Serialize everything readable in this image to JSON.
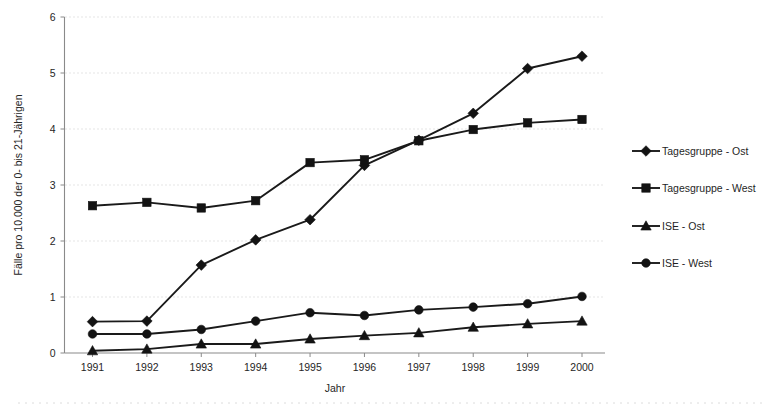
{
  "chart_data": {
    "type": "line",
    "title": "",
    "xlabel": "Jahr",
    "ylabel": "Fälle pro 10.000 der 0- bis 21-Jährigen",
    "categories": [
      "1991",
      "1992",
      "1993",
      "1994",
      "1995",
      "1996",
      "1997",
      "1998",
      "1999",
      "2000"
    ],
    "x": [
      1991,
      1992,
      1993,
      1994,
      1995,
      1996,
      1997,
      1998,
      1999,
      2000
    ],
    "xlim": [
      1991,
      2000
    ],
    "ylim": [
      0,
      6
    ],
    "yticks": [
      0,
      1,
      2,
      3,
      4,
      5,
      6
    ],
    "ytick_labels": [
      "0",
      "1",
      "2",
      "3",
      "4",
      "5",
      "6"
    ],
    "grid": "horizontal-dotted",
    "legend_position": "right",
    "series": [
      {
        "name": "Tagesgruppe - Ost",
        "marker": "diamond",
        "values": [
          0.56,
          0.57,
          1.57,
          2.02,
          2.38,
          3.35,
          3.8,
          4.28,
          5.08,
          5.3
        ]
      },
      {
        "name": "Tagesgruppe - West",
        "marker": "square",
        "values": [
          2.63,
          2.69,
          2.59,
          2.72,
          3.4,
          3.45,
          3.79,
          3.99,
          4.11,
          4.17
        ]
      },
      {
        "name": "ISE - Ost",
        "marker": "triangle",
        "values": [
          0.04,
          0.07,
          0.16,
          0.16,
          0.25,
          0.31,
          0.36,
          0.46,
          0.52,
          0.57
        ]
      },
      {
        "name": "ISE - West",
        "marker": "circle",
        "values": [
          0.34,
          0.34,
          0.42,
          0.57,
          0.72,
          0.67,
          0.77,
          0.82,
          0.88,
          1.01
        ]
      }
    ]
  },
  "legend": {
    "entries": [
      {
        "label": "Tagesgruppe - Ost"
      },
      {
        "label": "Tagesgruppe - West"
      },
      {
        "label": "ISE - Ost"
      },
      {
        "label": "ISE - West"
      }
    ]
  }
}
